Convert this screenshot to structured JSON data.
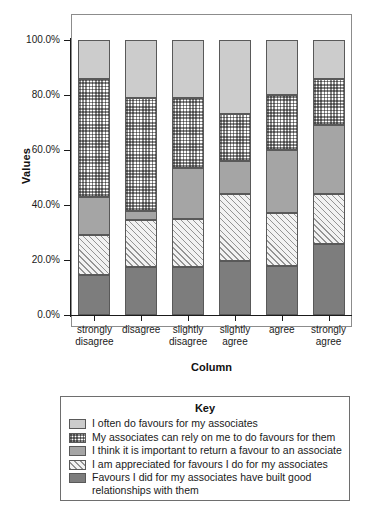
{
  "chart_data": {
    "type": "bar",
    "subtype": "stacked-bar-100-percent",
    "title": "",
    "xlabel": "Column",
    "ylabel": "Values",
    "ylim": [
      0,
      100
    ],
    "ytick_labels": [
      "0.0%",
      "20.0%",
      "40.0%",
      "60.0%",
      "80.0%",
      "100.0%"
    ],
    "ytick_values": [
      0,
      20,
      40,
      60,
      80,
      100
    ],
    "grid": false,
    "legend_position": "below-plot",
    "legend_title": "Key",
    "categories": [
      "strongly disagree",
      "disagree",
      "slightly disagree",
      "slightly agree",
      "agree",
      "strongly agree"
    ],
    "category_lines": [
      [
        "strongly",
        "disagree"
      ],
      [
        "disagree",
        ""
      ],
      [
        "slightly",
        "disagree"
      ],
      [
        "slightly",
        "agree"
      ],
      [
        "agree",
        ""
      ],
      [
        "strongly",
        "agree"
      ]
    ],
    "series": [
      {
        "name": "Favours I did for my associates have built good relationships with them",
        "pattern": "solid-dark-gray",
        "color": "#7d7d7d",
        "values": [
          14.5,
          17.5,
          17.5,
          19.5,
          18.0,
          26.0
        ]
      },
      {
        "name": "I am appreciated for favours I do for my associates",
        "pattern": "diagonal-hatch",
        "color": "#f2f2f2",
        "values": [
          14.5,
          17.0,
          17.5,
          24.5,
          19.0,
          18.0
        ]
      },
      {
        "name": "I think it is important to return a favour to an associate",
        "pattern": "solid-mid-gray",
        "color": "#a5a5a5",
        "values": [
          14.0,
          3.5,
          18.5,
          12.0,
          23.0,
          25.0
        ]
      },
      {
        "name": "My associates can rely on me to do favours for them",
        "pattern": "checkerboard",
        "color": "#ffffff",
        "values": [
          43.0,
          41.0,
          25.5,
          17.0,
          20.0,
          17.0
        ]
      },
      {
        "name": "I often do favours for my associates",
        "pattern": "solid-light-gray",
        "color": "#cccccc",
        "values": [
          14.0,
          21.0,
          21.0,
          27.0,
          20.0,
          14.0
        ]
      }
    ]
  },
  "axes": {
    "y_title": "Values",
    "x_title": "Column"
  },
  "legend": {
    "title": "Key",
    "items": [
      {
        "label": "I often do favours for my associates",
        "pattern": "solid-light-gray"
      },
      {
        "label": "My associates can rely on me to do favours for them",
        "pattern": "checkerboard"
      },
      {
        "label": "I think it is important to return a favour to an associate",
        "pattern": "solid-mid-gray"
      },
      {
        "label": "I am appreciated for favours I do for my associates",
        "pattern": "diagonal-hatch"
      },
      {
        "label": "Favours I did for my associates have built good relationships with them",
        "pattern": "solid-dark-gray"
      }
    ]
  }
}
